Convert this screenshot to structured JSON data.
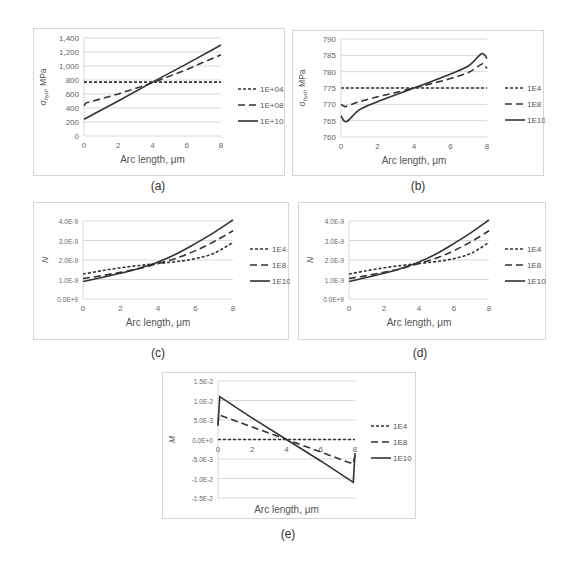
{
  "chart_data": [
    {
      "id": "a",
      "type": "line",
      "caption": "(a)",
      "xlabel": "Arc length, μm",
      "ylabel": "σhyd, MPa",
      "ylabel_main": "σ",
      "ylabel_sub": "hyd",
      "ylabel_unit": ", MPa",
      "xlim": [
        0,
        8
      ],
      "ylim": [
        0,
        1400
      ],
      "xticks": [
        "0",
        "2",
        "4",
        "6",
        "8"
      ],
      "yticks": [
        "0",
        "200",
        "400",
        "600",
        "800",
        "1,000",
        "1,200",
        "1,400"
      ],
      "grid": true,
      "legend_position": "right",
      "series": [
        {
          "name": "1E+04",
          "style": "short-dash",
          "x": [
            0,
            2,
            4,
            6,
            8
          ],
          "values": [
            770,
            770,
            770,
            770,
            770
          ]
        },
        {
          "name": "1E+08",
          "style": "long-dash",
          "x": [
            0,
            0.1,
            2,
            4,
            6,
            8
          ],
          "values": [
            430,
            470,
            600,
            760,
            950,
            1160
          ]
        },
        {
          "name": "1E+10",
          "style": "solid",
          "x": [
            0,
            2,
            4,
            6,
            8
          ],
          "values": [
            240,
            500,
            770,
            1030,
            1300
          ]
        }
      ]
    },
    {
      "id": "b",
      "type": "line",
      "caption": "(b)",
      "xlabel": "Arc length, μm",
      "ylabel": "σhyd, MPa",
      "ylabel_main": "σ",
      "ylabel_sub": "hyd",
      "ylabel_unit": ", MPa",
      "xlim": [
        0,
        8
      ],
      "ylim": [
        760,
        790
      ],
      "xticks": [
        "0",
        "2",
        "4",
        "6",
        "8"
      ],
      "yticks": [
        "760",
        "765",
        "770",
        "775",
        "780",
        "785",
        "790"
      ],
      "grid": true,
      "legend_position": "right",
      "series": [
        {
          "name": "1E4",
          "style": "short-dash",
          "x": [
            0,
            2,
            4,
            6,
            8
          ],
          "values": [
            775,
            775,
            775,
            775,
            775
          ]
        },
        {
          "name": "1E8",
          "style": "long-dash",
          "x": [
            0,
            0.2,
            1,
            2,
            3,
            4,
            5,
            6,
            7,
            7.8,
            8
          ],
          "values": [
            770,
            769.3,
            770.8,
            772.3,
            773.6,
            775,
            776.4,
            777.9,
            779.8,
            782.5,
            781
          ]
        },
        {
          "name": "1E10",
          "style": "solid",
          "x": [
            0,
            0.3,
            1,
            2,
            3,
            4,
            5,
            6,
            7,
            7.7,
            8
          ],
          "values": [
            766.5,
            764.7,
            768.3,
            770.8,
            772.9,
            775,
            777.1,
            779.3,
            781.8,
            785.5,
            784
          ]
        }
      ]
    },
    {
      "id": "c",
      "type": "line",
      "caption": "(c)",
      "xlabel": "Arc length, μm",
      "ylabel": "N",
      "xlim": [
        0,
        8
      ],
      "ylim": [
        0,
        4e-09
      ],
      "xticks": [
        "0",
        "2",
        "4",
        "6",
        "8"
      ],
      "yticks": [
        "0.0E+9",
        "1.0E-9",
        "2.0E-9",
        "3.0E-9",
        "4.0E-9"
      ],
      "grid": true,
      "legend_position": "right",
      "series": [
        {
          "name": "1E4",
          "style": "short-dash",
          "x": [
            0,
            1,
            2,
            3,
            4,
            5,
            6,
            7,
            8
          ],
          "values": [
            1.28e-09,
            1.45e-09,
            1.6e-09,
            1.72e-09,
            1.82e-09,
            1.92e-09,
            2.07e-09,
            2.35e-09,
            2.9e-09
          ]
        },
        {
          "name": "1E8",
          "style": "long-dash",
          "x": [
            0,
            1,
            2,
            3,
            4,
            5,
            6,
            7,
            8
          ],
          "values": [
            1.05e-09,
            1.2e-09,
            1.37e-09,
            1.56e-09,
            1.82e-09,
            2.1e-09,
            2.48e-09,
            2.95e-09,
            3.5e-09
          ]
        },
        {
          "name": "1E10",
          "style": "solid",
          "x": [
            0,
            1,
            2,
            3,
            4,
            5,
            6,
            7,
            8
          ],
          "values": [
            9e-10,
            1.1e-09,
            1.32e-09,
            1.58e-09,
            1.9e-09,
            2.32e-09,
            2.85e-09,
            3.42e-09,
            4.05e-09
          ]
        }
      ]
    },
    {
      "id": "d",
      "type": "line",
      "caption": "(d)",
      "xlabel": "Arc length, μm",
      "ylabel": "N",
      "xlim": [
        0,
        8
      ],
      "ylim": [
        0,
        4e-09
      ],
      "xticks": [
        "0",
        "2",
        "4",
        "6",
        "8"
      ],
      "yticks": [
        "0.0E+9",
        "1.0E-9",
        "2.0E-9",
        "3.0E-9",
        "4.0E-9"
      ],
      "grid": true,
      "legend_position": "right",
      "series": [
        {
          "name": "1E4",
          "style": "short-dash",
          "x": [
            0,
            1,
            2,
            3,
            4,
            5,
            6,
            7,
            8
          ],
          "values": [
            1.28e-09,
            1.45e-09,
            1.6e-09,
            1.72e-09,
            1.82e-09,
            1.92e-09,
            2.07e-09,
            2.35e-09,
            2.9e-09
          ]
        },
        {
          "name": "1E8",
          "style": "long-dash",
          "x": [
            0,
            1,
            2,
            3,
            4,
            5,
            6,
            7,
            8
          ],
          "values": [
            1.05e-09,
            1.2e-09,
            1.37e-09,
            1.56e-09,
            1.82e-09,
            2.1e-09,
            2.48e-09,
            2.95e-09,
            3.5e-09
          ]
        },
        {
          "name": "1E10",
          "style": "solid",
          "x": [
            0,
            1,
            2,
            3,
            4,
            5,
            6,
            7,
            8
          ],
          "values": [
            9e-10,
            1.1e-09,
            1.32e-09,
            1.58e-09,
            1.9e-09,
            2.32e-09,
            2.85e-09,
            3.42e-09,
            4.05e-09
          ]
        }
      ]
    },
    {
      "id": "e",
      "type": "line",
      "caption": "(e)",
      "xlabel": "Arc length, μm",
      "ylabel": "M",
      "xlim": [
        0,
        8
      ],
      "ylim": [
        -0.015,
        0.015
      ],
      "xticks": [
        "0",
        "2",
        "4",
        "6",
        "8"
      ],
      "yticks": [
        "-1.5E-2",
        "-1.0E-2",
        "-5.0E-3",
        "0.0E+0",
        "5.0E-3",
        "1.0E-2",
        "1.5E-2"
      ],
      "grid": true,
      "legend_position": "right",
      "series": [
        {
          "name": "1E4",
          "style": "short-dash",
          "x": [
            0,
            2,
            4,
            6,
            8
          ],
          "values": [
            0,
            0,
            0,
            0,
            0
          ]
        },
        {
          "name": "1E8",
          "style": "long-dash",
          "x": [
            0,
            0.05,
            2,
            4,
            6,
            7.9,
            8
          ],
          "values": [
            0.004,
            0.0063,
            0.0032,
            0,
            -0.0032,
            -0.0063,
            -0.004
          ]
        },
        {
          "name": "1E10",
          "style": "solid",
          "x": [
            0,
            0.1,
            2,
            4,
            6,
            7.9,
            8
          ],
          "values": [
            0.0035,
            0.011,
            0.0055,
            0,
            -0.0055,
            -0.011,
            -0.0035
          ]
        }
      ]
    }
  ]
}
